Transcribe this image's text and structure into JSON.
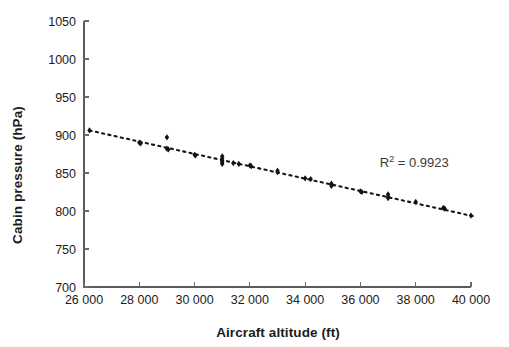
{
  "chart_data": {
    "type": "scatter",
    "title": "",
    "xlabel": "Aircraft altitude (ft)",
    "ylabel": "Cabin pressure (hPa)",
    "xlim": [
      26000,
      40000
    ],
    "ylim": [
      700,
      1050
    ],
    "grid": false,
    "legend": null,
    "x_tick_labels": [
      "26 000",
      "28 000",
      "30 000",
      "32 000",
      "34 000",
      "36 000",
      "38 000",
      "40 000"
    ],
    "x_tick_values": [
      26000,
      28000,
      30000,
      32000,
      34000,
      36000,
      38000,
      40000
    ],
    "y_tick_labels": [
      "700",
      "750",
      "800",
      "850",
      "900",
      "950",
      "1000",
      "1050"
    ],
    "y_tick_values": [
      700,
      750,
      800,
      850,
      900,
      950,
      1000,
      1050
    ],
    "annotations": [
      {
        "name": "r-squared",
        "text_prefix": "R",
        "text_sup": "2",
        "text_suffix": " = 0.9923",
        "full_text": "R2 = 0.9923",
        "value": 0.9923,
        "x": 36700,
        "y": 858
      }
    ],
    "trendline": {
      "style": "dotted",
      "color": "#171717",
      "x_start": 26200,
      "y_start": 906,
      "x_end": 40100,
      "y_end": 793,
      "r_squared": 0.9923
    },
    "series": [
      {
        "name": "Cabin pressure measurements",
        "marker": "filled-diamond",
        "color": "#121212",
        "points": [
          [
            26200,
            906
          ],
          [
            28000,
            890
          ],
          [
            28050,
            889
          ],
          [
            29000,
            897
          ],
          [
            29000,
            882
          ],
          [
            29050,
            881
          ],
          [
            30000,
            874
          ],
          [
            30030,
            873
          ],
          [
            31000,
            872
          ],
          [
            31000,
            869
          ],
          [
            31000,
            866
          ],
          [
            31000,
            864
          ],
          [
            31000,
            862
          ],
          [
            31400,
            863
          ],
          [
            31600,
            862
          ],
          [
            32000,
            860
          ],
          [
            32050,
            859
          ],
          [
            33000,
            853
          ],
          [
            33000,
            851
          ],
          [
            34000,
            843
          ],
          [
            34200,
            842
          ],
          [
            34950,
            836
          ],
          [
            34950,
            833
          ],
          [
            36000,
            826
          ],
          [
            36050,
            825
          ],
          [
            37000,
            822
          ],
          [
            37000,
            819
          ],
          [
            37000,
            817
          ],
          [
            38000,
            812
          ],
          [
            39000,
            804
          ],
          [
            39050,
            803
          ],
          [
            40000,
            794
          ]
        ]
      }
    ]
  },
  "figure": {
    "background_color": "#ffffff",
    "axis_color": "#5c5c5c",
    "text_color": "#1b1b1b",
    "marker_color": "#121212"
  }
}
